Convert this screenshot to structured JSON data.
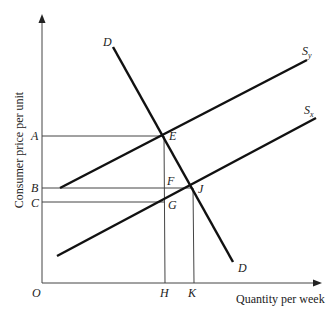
{
  "diagram": {
    "type": "supply-demand",
    "axes": {
      "y_label": "Consumer price per unit",
      "x_label": "Quantity per week",
      "origin_label": "O"
    },
    "price_levels": [
      {
        "label": "A",
        "point": "E"
      },
      {
        "label": "B",
        "point": "J"
      },
      {
        "label": "C",
        "point": "G"
      }
    ],
    "quantity_levels": [
      {
        "label": "H",
        "points": [
          "E",
          "F",
          "G"
        ]
      },
      {
        "label": "K",
        "point": "J"
      }
    ],
    "curves": {
      "demand": {
        "label_top": "D",
        "label_bottom": "D"
      },
      "supply_y": {
        "label": "S",
        "subscript": "y"
      },
      "supply_x": {
        "label": "S",
        "subscript": "x"
      }
    },
    "points": {
      "E": "E",
      "F": "F",
      "G": "G",
      "J": "J"
    }
  }
}
